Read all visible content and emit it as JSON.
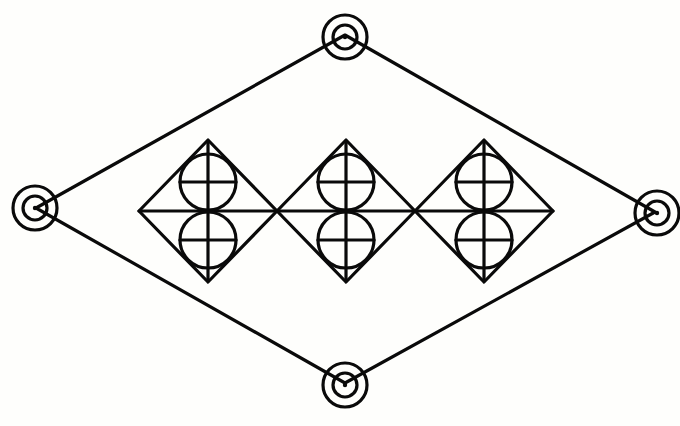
{
  "diagram": {
    "caption_top": "",
    "caption_bottom": "",
    "colors": {
      "background": "#fefefc",
      "stroke": "#0a0a0a"
    },
    "outer_diamond": {
      "vertices": {
        "top": {
          "x": 345,
          "y": 35
        },
        "right": {
          "x": 655,
          "y": 212
        },
        "bottom": {
          "x": 345,
          "y": 383
        },
        "left": {
          "x": 36,
          "y": 208
        }
      },
      "vertex_marker": {
        "type": "concentric-rings",
        "outer_radius": 22,
        "inner_radius": 12
      }
    },
    "inner_diamonds": [
      {
        "id": "diamond-1",
        "cx": 208,
        "cy": 211,
        "half_w": 69,
        "half_h": 71
      },
      {
        "id": "diamond-2",
        "cx": 346,
        "cy": 211,
        "half_w": 69,
        "half_h": 71
      },
      {
        "id": "diamond-3",
        "cx": 484,
        "cy": 211,
        "half_w": 69,
        "half_h": 71
      }
    ],
    "inner_motif": {
      "description": "Two stacked circles, each quartered by a cross, inscribed in a diamond bisected by a horizontal line",
      "circle_radius": 28,
      "top_circle_offset_y": -29,
      "bottom_circle_offset_y": 29
    },
    "horizontal_axis": {
      "x1": 139,
      "x2": 553,
      "y": 211
    }
  }
}
